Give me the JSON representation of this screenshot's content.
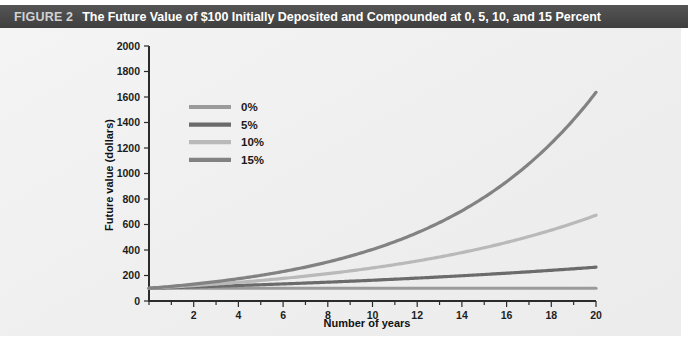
{
  "figure": {
    "number_label": "FIGURE 2",
    "title": "The Future Value of $100 Initially Deposited and Compounded at 0, 5, 10, and 15 Percent",
    "header_bg": "#4a4a4a",
    "panel_bg": "#f1f1f1"
  },
  "chart_data": {
    "type": "line",
    "title": "The Future Value of $100 Initially Deposited and Compounded at 0, 5, 10, and 15 Percent",
    "xlabel": "Number of years",
    "ylabel": "Future value (dollars)",
    "xlim": [
      0,
      20
    ],
    "ylim": [
      0,
      2000
    ],
    "xticks": [
      2,
      4,
      6,
      8,
      10,
      12,
      14,
      16,
      18,
      20
    ],
    "xtick_labels": [
      "2",
      "4",
      "6",
      "8",
      "10",
      "12",
      "14",
      "16",
      "18",
      "20"
    ],
    "x_minor_step": 1,
    "yticks": [
      0,
      200,
      400,
      600,
      800,
      1000,
      1200,
      1400,
      1600,
      1800,
      2000
    ],
    "ytick_labels": [
      "0",
      "200",
      "400",
      "600",
      "800",
      "1000",
      "1200",
      "1400",
      "1600",
      "1800",
      "2000"
    ],
    "grid": false,
    "legend_position": "upper-left-inside",
    "principal": 100,
    "x": [
      0,
      1,
      2,
      3,
      4,
      5,
      6,
      7,
      8,
      9,
      10,
      11,
      12,
      13,
      14,
      15,
      16,
      17,
      18,
      19,
      20
    ],
    "series": [
      {
        "name": "0%",
        "rate": 0,
        "color": "#9b9b9b",
        "values": [
          100,
          100,
          100,
          100,
          100,
          100,
          100,
          100,
          100,
          100,
          100,
          100,
          100,
          100,
          100,
          100,
          100,
          100,
          100,
          100,
          100
        ]
      },
      {
        "name": "5%",
        "rate": 0.05,
        "color": "#6b6b6b",
        "values": [
          100,
          105,
          110,
          116,
          122,
          128,
          134,
          141,
          148,
          155,
          163,
          171,
          180,
          189,
          198,
          208,
          218,
          229,
          241,
          253,
          265
        ]
      },
      {
        "name": "10%",
        "rate": 0.1,
        "color": "#b9b9b9",
        "values": [
          100,
          110,
          121,
          133,
          146,
          161,
          177,
          195,
          214,
          236,
          259,
          285,
          314,
          345,
          380,
          418,
          459,
          505,
          556,
          612,
          673
        ]
      },
      {
        "name": "15%",
        "rate": 0.15,
        "color": "#828282",
        "values": [
          100,
          115,
          132,
          152,
          175,
          201,
          231,
          266,
          306,
          352,
          405,
          465,
          535,
          615,
          708,
          814,
          936,
          1076,
          1238,
          1423,
          1637
        ]
      }
    ],
    "legend": [
      {
        "label": "0%",
        "color": "#9b9b9b"
      },
      {
        "label": "5%",
        "color": "#6b6b6b"
      },
      {
        "label": "10%",
        "color": "#b9b9b9"
      },
      {
        "label": "15%",
        "color": "#828282"
      }
    ]
  }
}
